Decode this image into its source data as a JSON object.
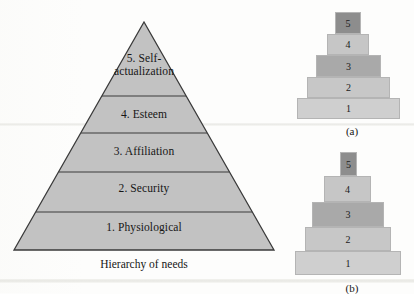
{
  "figure": {
    "type": "maslow-hierarchy-diagram",
    "background_color": "#fdfdfc"
  },
  "pyramid": {
    "caption": "Hierarchy of needs",
    "fill_color": "#c2c2c2",
    "stroke_color": "#3a3a3a",
    "apex": {
      "x": 144,
      "y": 22
    },
    "base": {
      "left_x": 14,
      "right_x": 274,
      "y": 250
    },
    "divider_y": [
      96,
      133,
      172,
      212
    ],
    "levels": [
      {
        "number": 5,
        "label_line1": "5. Self-",
        "label_line2": "actualization",
        "label": "5. Self-actualization"
      },
      {
        "number": 4,
        "label_line1": "4. Esteem",
        "label_line2": "",
        "label": "4. Esteem"
      },
      {
        "number": 3,
        "label_line1": "3. Affiliation",
        "label_line2": "",
        "label": "3. Affiliation"
      },
      {
        "number": 2,
        "label_line1": "2. Security",
        "label_line2": "",
        "label": "2. Security"
      },
      {
        "number": 1,
        "label_line1": "1. Physiological",
        "label_line2": "",
        "label": "1. Physiological"
      }
    ]
  },
  "stack_a": {
    "caption": "(a)",
    "bars": [
      {
        "label": "5",
        "left": 45,
        "top": 8,
        "width": 26,
        "height": 22,
        "color": "#8d8d8d"
      },
      {
        "label": "4",
        "left": 37,
        "top": 30,
        "width": 42,
        "height": 21,
        "color": "#c6c6c6"
      },
      {
        "label": "3",
        "left": 26,
        "top": 51,
        "width": 65,
        "height": 22,
        "color": "#a9a9a9"
      },
      {
        "label": "2",
        "left": 17,
        "top": 73,
        "width": 83,
        "height": 21,
        "color": "#c7c7c7"
      },
      {
        "label": "1",
        "left": 7,
        "top": 94,
        "width": 103,
        "height": 21,
        "color": "#cfcfcf"
      }
    ],
    "caption_top": 121
  },
  "stack_b": {
    "caption": "(b)",
    "bars": [
      {
        "label": "5",
        "left": 50,
        "top": 6,
        "width": 17,
        "height": 24,
        "color": "#8d8d8d"
      },
      {
        "label": "4",
        "left": 34,
        "top": 30,
        "width": 47,
        "height": 26,
        "color": "#c6c6c6"
      },
      {
        "label": "3",
        "left": 22,
        "top": 56,
        "width": 72,
        "height": 25,
        "color": "#a9a9a9"
      },
      {
        "label": "2",
        "left": 15,
        "top": 81,
        "width": 86,
        "height": 24,
        "color": "#c7c7c7"
      },
      {
        "label": "1",
        "left": 5,
        "top": 105,
        "width": 106,
        "height": 24,
        "color": "#cfcfcf"
      }
    ],
    "caption_top": 136
  }
}
